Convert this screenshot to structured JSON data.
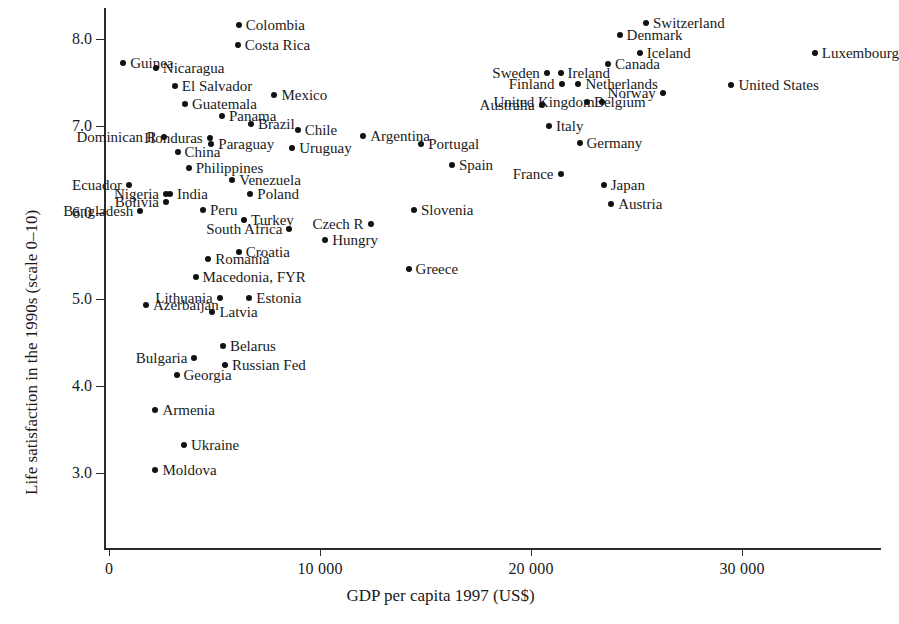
{
  "chart_data": {
    "type": "scatter",
    "title": "",
    "xlabel": "GDP per capita 1997 (US$)",
    "ylabel": "Life satisfaction in the 1990s (scale 0–10)",
    "xlim": [
      -1000,
      36600
    ],
    "ylim": [
      2.75,
      8.35
    ],
    "grid": false,
    "legend": "none",
    "xticks": [
      0,
      10000,
      20000,
      30000
    ],
    "xticklabels": [
      "0",
      "10 000",
      "20 000",
      "30 000"
    ],
    "yticks": [
      3.0,
      4.0,
      5.0,
      6.0,
      7.0,
      8.0
    ],
    "yticklabels": [
      "3.0",
      "4.0",
      "5.0",
      "6.0",
      "7.0",
      "8.0"
    ],
    "point_color": "#111111",
    "axis_color": "#2a2a2a",
    "points": [
      {
        "name": "Colombia",
        "x": 6150,
        "y": 8.16,
        "side": "right"
      },
      {
        "name": "Costa Rica",
        "x": 6100,
        "y": 7.93,
        "side": "right"
      },
      {
        "name": "Switzerland",
        "x": 25450,
        "y": 8.18,
        "side": "right"
      },
      {
        "name": "Denmark",
        "x": 24200,
        "y": 8.05,
        "side": "right"
      },
      {
        "name": "Iceland",
        "x": 25150,
        "y": 7.84,
        "side": "right"
      },
      {
        "name": "Luxembourg",
        "x": 33450,
        "y": 7.84,
        "side": "right"
      },
      {
        "name": "Guinea",
        "x": 670,
        "y": 7.72,
        "side": "right"
      },
      {
        "name": "Canada",
        "x": 23650,
        "y": 7.71,
        "side": "right"
      },
      {
        "name": "Ireland",
        "x": 21400,
        "y": 7.61,
        "side": "right"
      },
      {
        "name": "Sweden",
        "x": 20750,
        "y": 7.61,
        "side": "left"
      },
      {
        "name": "Nicaragua",
        "x": 2220,
        "y": 7.67,
        "side": "right"
      },
      {
        "name": "Netherlands",
        "x": 22250,
        "y": 7.48,
        "side": "right"
      },
      {
        "name": "Finland",
        "x": 21450,
        "y": 7.48,
        "side": "left"
      },
      {
        "name": "United States",
        "x": 29500,
        "y": 7.47,
        "side": "right"
      },
      {
        "name": "El Salvador",
        "x": 3120,
        "y": 7.46,
        "side": "right"
      },
      {
        "name": "Norway",
        "x": 26250,
        "y": 7.38,
        "side": "left"
      },
      {
        "name": "Mexico",
        "x": 7840,
        "y": 7.36,
        "side": "right"
      },
      {
        "name": "Belgium",
        "x": 22650,
        "y": 7.27,
        "side": "right"
      },
      {
        "name": "United Kingdom",
        "x": 23350,
        "y": 7.27,
        "side": "left"
      },
      {
        "name": "Guatemala",
        "x": 3600,
        "y": 7.25,
        "side": "right"
      },
      {
        "name": "Australia",
        "x": 20500,
        "y": 7.24,
        "side": "left"
      },
      {
        "name": "Panama",
        "x": 5350,
        "y": 7.11,
        "side": "right"
      },
      {
        "name": "Italy",
        "x": 20850,
        "y": 7.0,
        "side": "right"
      },
      {
        "name": "Brazil",
        "x": 6730,
        "y": 7.02,
        "side": "right"
      },
      {
        "name": "Dominican R",
        "x": 2600,
        "y": 6.87,
        "side": "left"
      },
      {
        "name": "Honduras",
        "x": 4770,
        "y": 6.86,
        "side": "left"
      },
      {
        "name": "Chile",
        "x": 8940,
        "y": 6.95,
        "side": "right"
      },
      {
        "name": "Argentina",
        "x": 12050,
        "y": 6.88,
        "side": "right"
      },
      {
        "name": "Paraguay",
        "x": 4850,
        "y": 6.79,
        "side": "right"
      },
      {
        "name": "Germany",
        "x": 22300,
        "y": 6.8,
        "side": "right"
      },
      {
        "name": "Portugal",
        "x": 14800,
        "y": 6.79,
        "side": "right"
      },
      {
        "name": "Uruguay",
        "x": 8680,
        "y": 6.74,
        "side": "right"
      },
      {
        "name": "China",
        "x": 3250,
        "y": 6.7,
        "side": "right"
      },
      {
        "name": "Spain",
        "x": 16250,
        "y": 6.55,
        "side": "right"
      },
      {
        "name": "Philippines",
        "x": 3780,
        "y": 6.51,
        "side": "right"
      },
      {
        "name": "France",
        "x": 21400,
        "y": 6.44,
        "side": "left"
      },
      {
        "name": "Venezuela",
        "x": 5840,
        "y": 6.38,
        "side": "right"
      },
      {
        "name": "Ecuador",
        "x": 950,
        "y": 6.32,
        "side": "left"
      },
      {
        "name": "Japan",
        "x": 23450,
        "y": 6.32,
        "side": "right"
      },
      {
        "name": "Nigeria",
        "x": 2700,
        "y": 6.22,
        "side": "left"
      },
      {
        "name": "India",
        "x": 2890,
        "y": 6.21,
        "side": "right"
      },
      {
        "name": "Poland",
        "x": 6700,
        "y": 6.21,
        "side": "right"
      },
      {
        "name": "Austria",
        "x": 23800,
        "y": 6.1,
        "side": "right"
      },
      {
        "name": "Bolivia",
        "x": 2700,
        "y": 6.12,
        "side": "left"
      },
      {
        "name": "Bangladesh",
        "x": 1480,
        "y": 6.02,
        "side": "left"
      },
      {
        "name": "Peru",
        "x": 4450,
        "y": 6.03,
        "side": "right"
      },
      {
        "name": "Slovenia",
        "x": 14450,
        "y": 6.03,
        "side": "right"
      },
      {
        "name": "Czech R",
        "x": 12400,
        "y": 5.87,
        "side": "left"
      },
      {
        "name": "Turkey",
        "x": 6400,
        "y": 5.92,
        "side": "right"
      },
      {
        "name": "South Africa",
        "x": 8550,
        "y": 5.81,
        "side": "left"
      },
      {
        "name": "Hungry",
        "x": 10250,
        "y": 5.68,
        "side": "right"
      },
      {
        "name": "Croatia",
        "x": 6150,
        "y": 5.55,
        "side": "right"
      },
      {
        "name": "Romania",
        "x": 4700,
        "y": 5.46,
        "side": "right"
      },
      {
        "name": "Greece",
        "x": 14200,
        "y": 5.35,
        "side": "right"
      },
      {
        "name": "Macedonia, FYR",
        "x": 4100,
        "y": 5.26,
        "side": "right"
      },
      {
        "name": "Lithuania",
        "x": 5250,
        "y": 5.02,
        "side": "left"
      },
      {
        "name": "Estonia",
        "x": 6650,
        "y": 5.02,
        "side": "right"
      },
      {
        "name": "Azerbaijan",
        "x": 1750,
        "y": 4.94,
        "side": "right"
      },
      {
        "name": "Latvia",
        "x": 4900,
        "y": 4.86,
        "side": "right"
      },
      {
        "name": "Belarus",
        "x": 5400,
        "y": 4.46,
        "side": "right"
      },
      {
        "name": "Bulgaria",
        "x": 4050,
        "y": 4.33,
        "side": "left"
      },
      {
        "name": "Russian Fed",
        "x": 5500,
        "y": 4.25,
        "side": "right"
      },
      {
        "name": "Georgia",
        "x": 3200,
        "y": 4.13,
        "side": "right"
      },
      {
        "name": "Armenia",
        "x": 2200,
        "y": 3.73,
        "side": "right"
      },
      {
        "name": "Ukraine",
        "x": 3550,
        "y": 3.32,
        "side": "right"
      },
      {
        "name": "Moldova",
        "x": 2200,
        "y": 3.04,
        "side": "right"
      }
    ]
  }
}
